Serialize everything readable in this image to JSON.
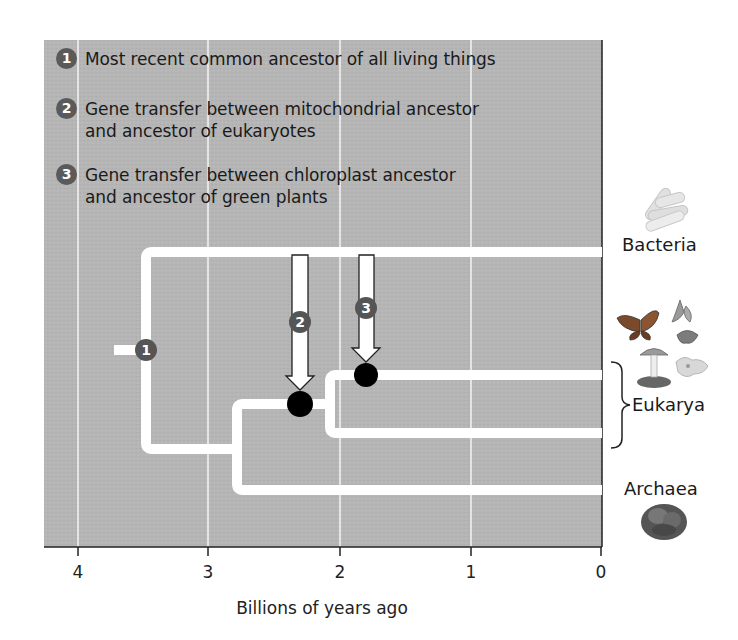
{
  "legend": {
    "items": [
      {
        "number": "1",
        "line1": "Most recent common ancestor of all living things",
        "line2": ""
      },
      {
        "number": "2",
        "line1": "Gene transfer between mitochondrial ancestor",
        "line2": "and ancestor of eukaryotes"
      },
      {
        "number": "3",
        "line1": "Gene transfer between chloroplast ancestor",
        "line2": "and ancestor of green plants"
      }
    ]
  },
  "axis": {
    "title": "Billions of years ago",
    "ticks": [
      "4",
      "3",
      "2",
      "1",
      "0"
    ]
  },
  "tree": {
    "markers": [
      {
        "number": "1",
        "label": "Most recent common ancestor of all living things",
        "time_bya": 3.5
      },
      {
        "number": "2",
        "label": "Gene transfer between mitochondrial ancestor and ancestor of eukaryotes",
        "time_bya": 2.3
      },
      {
        "number": "3",
        "label": "Gene transfer between chloroplast ancestor and ancestor of green plants",
        "time_bya": 1.8
      }
    ],
    "taxa": [
      {
        "name": "Bacteria",
        "icon": "rod-bacteria-icon"
      },
      {
        "name": "Eukarya",
        "icon": "butterfly-flower-mushroom-amoeba-icon"
      },
      {
        "name": "Archaea",
        "icon": "archaea-cell-icon"
      }
    ]
  },
  "colors": {
    "panel": "#b4b4b4",
    "branch": "#ffffff",
    "gridline": "#f2f2f2",
    "marker": "#555555",
    "event_dot": "#000000"
  }
}
